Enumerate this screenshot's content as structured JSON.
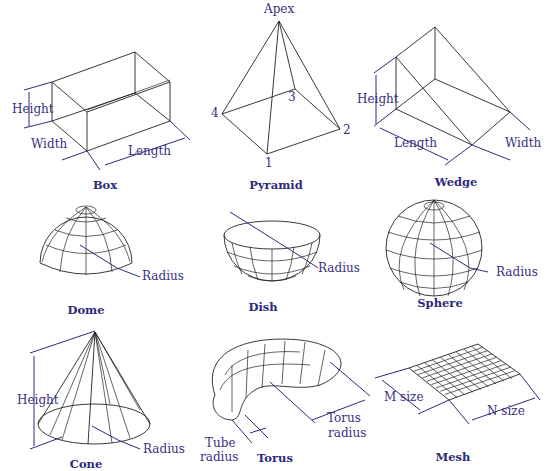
{
  "shapes": {
    "box": {
      "title": "Box",
      "labels": {
        "height": "Height",
        "width": "Width",
        "length": "Length"
      }
    },
    "pyramid": {
      "title": "Pyramid",
      "labels": {
        "apex": "Apex",
        "v1": "1",
        "v2": "2",
        "v3": "3",
        "v4": "4"
      }
    },
    "wedge": {
      "title": "Wedge",
      "labels": {
        "height": "Height",
        "length": "Length",
        "width": "Width"
      }
    },
    "dome": {
      "title": "Dome",
      "labels": {
        "radius": "Radius"
      }
    },
    "dish": {
      "title": "Dish",
      "labels": {
        "radius": "Radius"
      }
    },
    "sphere": {
      "title": "Sphere",
      "labels": {
        "radius": "Radius"
      }
    },
    "cone": {
      "title": "Cone",
      "labels": {
        "height": "Height",
        "radius": "Radius"
      }
    },
    "torus": {
      "title": "Torus",
      "labels": {
        "tube_radius_1": "Tube",
        "tube_radius_2": "radius",
        "torus_radius_1": "Torus",
        "torus_radius_2": "radius"
      }
    },
    "mesh": {
      "title": "Mesh",
      "labels": {
        "m_size": "M size",
        "n_size": "N size"
      }
    }
  },
  "colors": {
    "label": "#3a2f82",
    "line": "#222222",
    "background": "#ffffff"
  }
}
